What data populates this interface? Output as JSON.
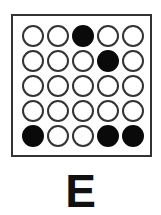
{
  "puzzle": {
    "rows": 5,
    "cols": 5,
    "grid": [
      [
        0,
        0,
        1,
        0,
        0
      ],
      [
        0,
        0,
        0,
        1,
        0
      ],
      [
        0,
        0,
        0,
        0,
        0
      ],
      [
        0,
        0,
        0,
        0,
        0
      ],
      [
        1,
        0,
        0,
        1,
        1
      ]
    ],
    "label": "E"
  }
}
